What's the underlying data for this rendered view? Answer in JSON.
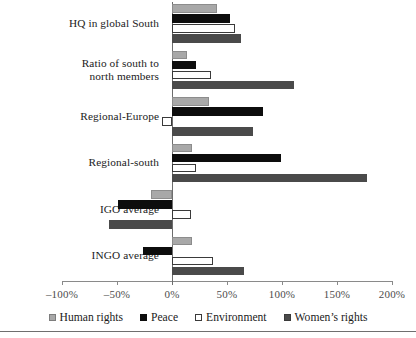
{
  "chart_data": {
    "type": "bar",
    "orientation": "horizontal",
    "title": "",
    "xlabel": "",
    "ylabel": "",
    "xlim": [
      -100,
      200
    ],
    "xticks": [
      -100,
      -50,
      0,
      50,
      100,
      150,
      200
    ],
    "xtick_labels": [
      "–100%",
      "–50%",
      "0%",
      "50%",
      "100%",
      "150%",
      "200%"
    ],
    "grid": false,
    "legend_position": "bottom",
    "categories": [
      "HQ in global South",
      "Ratio of south to\nnorth members",
      "Regional-Europe",
      "Regional-south",
      "IGO average",
      "INGO average"
    ],
    "series": [
      {
        "name": "Human rights",
        "color": "#a8a8a8",
        "values": [
          41,
          14,
          34,
          18,
          -19,
          18
        ]
      },
      {
        "name": "Peace",
        "color": "#0d0d0d",
        "values": [
          53,
          22,
          83,
          99,
          -49,
          -26
        ]
      },
      {
        "name": "Environment",
        "color": "#ffffff",
        "values": [
          57,
          35,
          -9,
          22,
          17,
          37
        ]
      },
      {
        "name": "Women's rights",
        "color": "#4a4a4a",
        "values": [
          63,
          111,
          74,
          177,
          -57,
          65
        ]
      }
    ]
  },
  "legend": {
    "items": [
      {
        "label": "Human rights",
        "swatch": "s-hr"
      },
      {
        "label": "Peace",
        "swatch": "s-peace"
      },
      {
        "label": "Environment",
        "swatch": "s-env"
      },
      {
        "label": "Women’s rights",
        "swatch": "s-wr"
      }
    ]
  }
}
